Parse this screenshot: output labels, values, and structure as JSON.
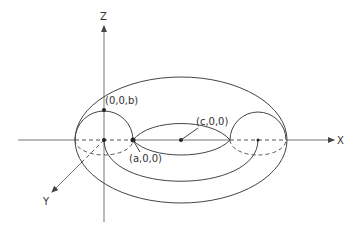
{
  "diagram": {
    "type": "torus",
    "axes": {
      "x_label": "X",
      "y_label": "Y",
      "z_label": "Z"
    },
    "points": [
      {
        "id": "top-of-tube",
        "label": "(0,0,b)"
      },
      {
        "id": "inner-point",
        "label": "(a,0,0)"
      },
      {
        "id": "center-point",
        "label": "(c,0,0)"
      }
    ],
    "colors": {
      "line": "#444444",
      "axis": "#777777",
      "text": "#333333",
      "background": "#ffffff"
    }
  }
}
